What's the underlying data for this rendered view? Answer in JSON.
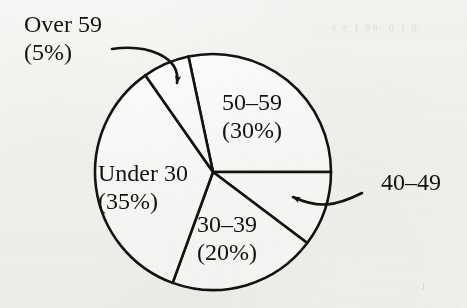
{
  "chart_data": {
    "type": "pie",
    "title": "",
    "subtitle": "",
    "xlabel": "",
    "ylabel": "",
    "legend_position": "none",
    "grid": false,
    "units": "percent",
    "total": 100,
    "categories": [
      "50–59",
      "40–49",
      "30–39",
      "Under 30",
      "Over 59"
    ],
    "values": [
      30,
      10,
      20,
      35,
      5
    ],
    "labels": [
      "50–59\n(30%)",
      "40–49",
      "30–39\n(20%)",
      "Under 30\n(35%)",
      "Over 59\n(5%)"
    ],
    "slices": [
      {
        "name": "50–59",
        "label_line1": "50–59",
        "label_line2": "(30%)",
        "value": 30,
        "percent_text": "(30%)",
        "start_angle_deg": -12,
        "end_angle_deg": 90,
        "label_placement": "inside",
        "label_x": 252,
        "label_y": 110,
        "label_anchor": "middle",
        "fill": "#ffffff",
        "stroke": "#15120f"
      },
      {
        "name": "40–49",
        "label_line1": "40–49",
        "label_line2": "",
        "value": 10,
        "percent_text": "",
        "start_angle_deg": 90,
        "end_angle_deg": 127,
        "label_placement": "outside-leader",
        "label_x": 381,
        "label_y": 190,
        "label_anchor": "start",
        "fill": "#ffffff",
        "stroke": "#15120f"
      },
      {
        "name": "30–39",
        "label_line1": "30–39",
        "label_line2": "(20%)",
        "value": 20,
        "percent_text": "(20%)",
        "start_angle_deg": 127,
        "end_angle_deg": 200,
        "label_placement": "inside",
        "label_x": 197,
        "label_y": 232,
        "label_anchor": "start",
        "fill": "#ffffff",
        "stroke": "#15120f"
      },
      {
        "name": "Under 30",
        "label_line1": "Under 30",
        "label_line2": "(35%)",
        "value": 35,
        "percent_text": "(35%)",
        "start_angle_deg": 200,
        "end_angle_deg": 325,
        "label_placement": "inside",
        "label_x": 98,
        "label_y": 181,
        "label_anchor": "start",
        "fill": "#ffffff",
        "stroke": "#15120f"
      },
      {
        "name": "Over 59",
        "label_line1": "Over 59",
        "label_line2": "(5%)",
        "value": 5,
        "percent_text": "(5%)",
        "start_angle_deg": 325,
        "end_angle_deg": 348,
        "label_placement": "outside-leader",
        "label_x": 24,
        "label_y": 32,
        "label_anchor": "start",
        "fill": "#ffffff",
        "stroke": "#15120f"
      }
    ],
    "geometry": {
      "center_x": 213,
      "center_y": 172,
      "radius": 118,
      "stroke_width": 2.6
    },
    "colors": {
      "background": "#f7f7f5",
      "ink": "#15120f",
      "slice_fill": "#ffffff"
    }
  },
  "annotations": {
    "over59_leader": {
      "name": "Over 59 leader arrow",
      "from_x": 112,
      "from_y": 49,
      "to_x": 177,
      "to_y": 83
    },
    "age4049_leader": {
      "name": "40–49 leader arrow",
      "from_x": 362,
      "from_y": 193,
      "to_x": 293,
      "to_y": 197
    }
  },
  "ghost_marks": [
    {
      "text": "c c  1 96: 0  1 0",
      "x": 332,
      "y": 22
    },
    {
      "text": "1",
      "x": 421,
      "y": 281
    }
  ]
}
